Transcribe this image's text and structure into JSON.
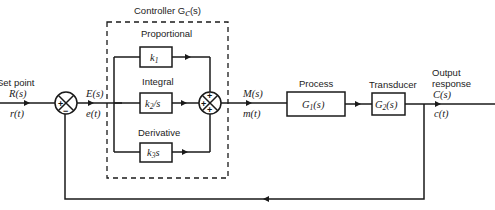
{
  "diagram": {
    "type": "closed-loop PID control block diagram",
    "controller": {
      "title": "Controller G",
      "title_sub": "c",
      "title_arg": "(s)"
    },
    "input": {
      "label": "Set point",
      "laplace": "R(s)",
      "time": "r(t)"
    },
    "error": {
      "laplace": "E(s)",
      "time": "e(t)"
    },
    "summing_junction_1": {
      "signs": [
        "+",
        "−"
      ]
    },
    "branches": [
      {
        "name": "Proportional",
        "block": "k",
        "sub": "1",
        "suffix": ""
      },
      {
        "name": "Integral",
        "block": "k",
        "sub": "2",
        "suffix": "/s"
      },
      {
        "name": "Derivative",
        "block": "k",
        "sub": "3",
        "suffix": "s"
      }
    ],
    "summing_junction_2": {
      "signs": [
        "+",
        "+",
        "+"
      ]
    },
    "manipulated": {
      "laplace": "M(s)",
      "time": "m(t)"
    },
    "process": {
      "label": "Process",
      "block": "G",
      "sub": "1",
      "arg": "(s)"
    },
    "transducer": {
      "label": "Transducer",
      "block": "G",
      "sub": "2",
      "arg": "(s)"
    },
    "output": {
      "label_line1": "Output",
      "label_line2": "response",
      "laplace": "C(s)",
      "time": "c(t)"
    }
  }
}
